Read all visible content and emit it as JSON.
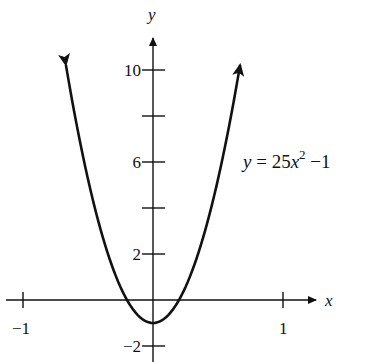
{
  "chart_data": {
    "type": "line",
    "title": "",
    "equation_label": "y = 25x² − 1",
    "equation": {
      "lhs": "y",
      "eq": " = 25",
      "var": "x",
      "exp": "2",
      "rest": " −1"
    },
    "xlabel": "x",
    "ylabel": "y",
    "x_ticks": [
      -1,
      1
    ],
    "x_tick_labels": [
      "−1",
      "1"
    ],
    "y_ticks": [
      -2,
      0,
      2,
      4,
      6,
      8,
      10
    ],
    "y_tick_labels": [
      {
        "value": -2,
        "label": "−2"
      },
      {
        "value": 2,
        "label": "2"
      },
      {
        "value": 6,
        "label": "6"
      },
      {
        "value": 10,
        "label": "10"
      }
    ],
    "xlim": [
      -1.1,
      1.25
    ],
    "ylim": [
      -2.5,
      12.5
    ],
    "series": [
      {
        "name": "y = 25x^2 - 1",
        "function": "25*x^2 - 1",
        "x_range": [
          -0.67,
          0.67
        ],
        "x": [
          -0.6,
          -0.4,
          -0.2,
          0,
          0.2,
          0.4,
          0.6
        ],
        "y": [
          8,
          3,
          0,
          -1,
          0,
          3,
          8
        ],
        "arrows_at_ends": true
      }
    ],
    "grid": false,
    "legend": "none"
  }
}
